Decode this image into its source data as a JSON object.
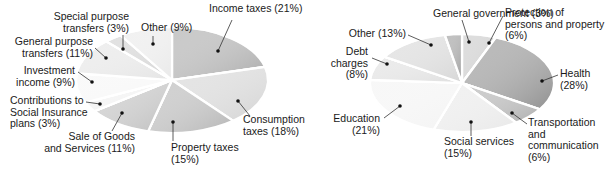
{
  "chart_data": [
    {
      "type": "pie",
      "title": "",
      "center": [
        172,
        80
      ],
      "radius": [
        96,
        53
      ],
      "start_angle": -90,
      "categories": [
        "Income taxes",
        "Consumption taxes",
        "Property taxes",
        "Sale of Goods and Services",
        "Contributions to Social Insurance plans",
        "Investment income",
        "General purpose transfers",
        "Special purpose transfers",
        "Other"
      ],
      "values": [
        21,
        18,
        15,
        11,
        3,
        9,
        11,
        3,
        9
      ],
      "colors": [
        "#a9a9a9",
        "#d3d3d3",
        "#b4b4b4",
        "#bdbdbd",
        "#f0f0f0",
        "#f6f6f6",
        "#e4e4e4",
        "#d0d0d0",
        "#e9e9e9"
      ],
      "labels": [
        {
          "lines": [
            "Income taxes (21%)"
          ],
          "x": 209,
          "y": 12,
          "anchor": "start",
          "dot": [
            218,
            51
          ],
          "line_to": [
            232,
            20
          ]
        },
        {
          "lines": [
            "Consumption",
            "taxes (18%)"
          ],
          "x": 243,
          "y": 123,
          "anchor": "start",
          "dot": [
            238,
            101
          ],
          "line_to": [
            250,
            116
          ]
        },
        {
          "lines": [
            "Property taxes",
            "(15%)"
          ],
          "x": 171,
          "y": 151,
          "anchor": "start",
          "dot": [
            173,
            122
          ],
          "line_to": [
            173,
            141
          ]
        },
        {
          "lines": [
            "Sale of Goods",
            "and Services (11%)"
          ],
          "x": 135,
          "y": 140,
          "anchor": "end",
          "dot": [
            122,
            113
          ],
          "line_to": [
            112,
            131
          ]
        },
        {
          "lines": [
            "Contributions to",
            "Social Insurance",
            "plans (3%)"
          ],
          "x": 10,
          "y": 104,
          "anchor": "start",
          "dot": [
            100,
            104
          ],
          "line_to": [
            86,
            102
          ]
        },
        {
          "lines": [
            "Investment",
            "income (9%)"
          ],
          "x": 75,
          "y": 74,
          "anchor": "end",
          "dot": [
            92,
            82
          ],
          "line_to": [
            78,
            72
          ]
        },
        {
          "lines": [
            "General purpose",
            "transfers (11%)"
          ],
          "x": 93,
          "y": 45,
          "anchor": "end",
          "dot": [
            106,
            58
          ],
          "line_to": [
            95,
            48
          ]
        },
        {
          "lines": [
            "Special purpose",
            "transfers (3%)"
          ],
          "x": 129,
          "y": 20,
          "anchor": "end",
          "dot": [
            123,
            49
          ],
          "line_to": [
            123,
            35
          ]
        },
        {
          "lines": [
            "Other (9%)"
          ],
          "x": 141,
          "y": 31,
          "anchor": "start",
          "dot": [
            153,
            44
          ],
          "line_to": [
            153,
            36
          ]
        }
      ]
    },
    {
      "type": "pie",
      "title": "",
      "center": [
        462,
        83
      ],
      "radius": [
        92,
        49
      ],
      "start_angle": -90,
      "categories": [
        "Protection of persons and property",
        "Health",
        "Transportation and communication",
        "Social services",
        "Education",
        "Debt charges",
        "Other",
        "General government"
      ],
      "values": [
        6,
        28,
        6,
        15,
        21,
        8,
        13,
        3
      ],
      "colors": [
        "#c8c8c8",
        "#8f8f8f",
        "#adadad",
        "#e8e8e8",
        "#f3f3f3",
        "#dedede",
        "#d6d6d6",
        "#9a9a9a"
      ],
      "labels": [
        {
          "lines": [
            "Protection of",
            "persons and property",
            "(6%)"
          ],
          "x": 505,
          "y": 16,
          "anchor": "start",
          "dot": [
            489,
            43
          ],
          "line_to": [
            503,
            16
          ]
        },
        {
          "lines": [
            "Health",
            "(28%)"
          ],
          "x": 560,
          "y": 77,
          "anchor": "start",
          "dot": [
            542,
            81
          ],
          "line_to": [
            558,
            75
          ]
        },
        {
          "lines": [
            "Transportation",
            "and",
            "communication",
            "(6%)"
          ],
          "x": 528,
          "y": 126,
          "anchor": "start",
          "dot": [
            512,
            113
          ],
          "line_to": [
            527,
            124
          ]
        },
        {
          "lines": [
            "Social services",
            "(15%)"
          ],
          "x": 444,
          "y": 145,
          "anchor": "start",
          "dot": [
            471,
            122
          ],
          "line_to": [
            471,
            136
          ]
        },
        {
          "lines": [
            "Education",
            "(21%)"
          ],
          "x": 380,
          "y": 122,
          "anchor": "end",
          "dot": [
            400,
            106
          ],
          "line_to": [
            384,
            118
          ]
        },
        {
          "lines": [
            "Debt",
            "charges",
            "(8%)"
          ],
          "x": 368,
          "y": 55,
          "anchor": "end",
          "dot": [
            387,
            64
          ],
          "line_to": [
            372,
            58
          ]
        },
        {
          "lines": [
            "Other (13%)"
          ],
          "x": 406,
          "y": 37,
          "anchor": "end",
          "dot": [
            431,
            45
          ],
          "line_to": [
            408,
            35
          ]
        },
        {
          "lines": [
            "General government (3%)"
          ],
          "x": 433,
          "y": 17,
          "anchor": "start",
          "dot": [
            469,
            42
          ],
          "line_to": [
            462,
            20
          ]
        }
      ]
    }
  ]
}
